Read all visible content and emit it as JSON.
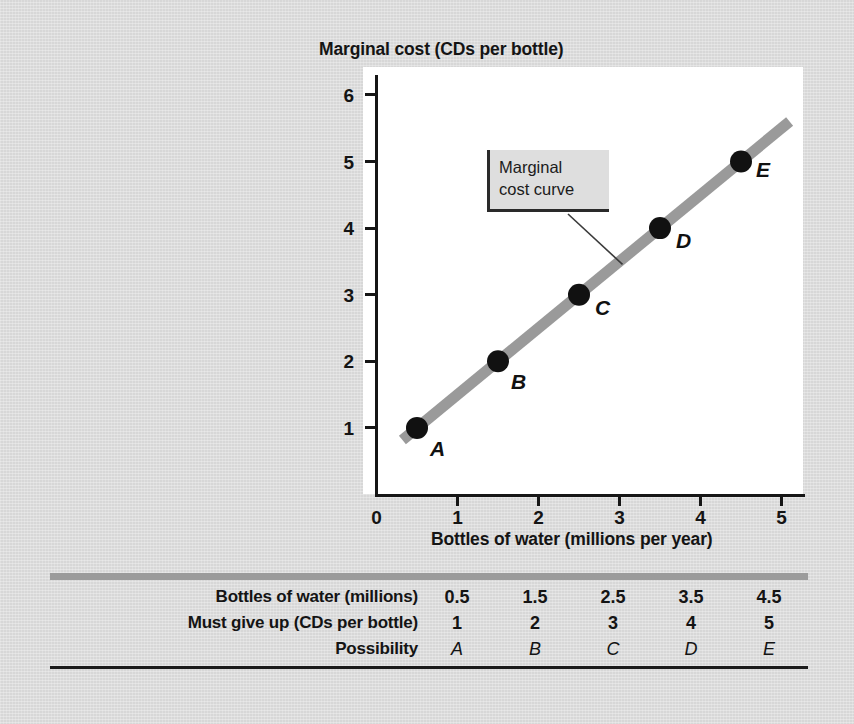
{
  "figure": {
    "background_color": "#dcdcdc",
    "panel_color": "#ffffff"
  },
  "chart_data": {
    "type": "line",
    "title": "",
    "xlabel": "Bottles of water (millions per year)",
    "ylabel": "Marginal cost (CDs per bottle)",
    "xlim": [
      0,
      5.4
    ],
    "ylim": [
      0,
      6.4
    ],
    "xticks": [
      "0",
      "1",
      "2",
      "3",
      "4",
      "5"
    ],
    "yticks": [
      "1",
      "2",
      "3",
      "4",
      "5",
      "6"
    ],
    "grid": false,
    "legend_position": "none",
    "series": [
      {
        "name": "Marginal cost curve",
        "color": "#9a9a9a",
        "x": [
          0.5,
          1.5,
          2.5,
          3.5,
          4.5
        ],
        "values": [
          1,
          2,
          3,
          4,
          5
        ],
        "point_labels": [
          "A",
          "B",
          "C",
          "D",
          "E"
        ],
        "line_extent_x": [
          0.32,
          5.1
        ]
      }
    ],
    "annotations": [
      {
        "text": "Marginal\ncost curve",
        "target_x": 3.0,
        "target_y": 3.5
      }
    ]
  },
  "points": [
    {
      "label": "A",
      "x": 0.5,
      "y": 1,
      "label_dx": 13,
      "label_dy": 10
    },
    {
      "label": "B",
      "x": 1.5,
      "y": 2,
      "label_dx": 13,
      "label_dy": 10
    },
    {
      "label": "C",
      "x": 2.5,
      "y": 3,
      "label_dx": 16,
      "label_dy": 2
    },
    {
      "label": "D",
      "x": 3.5,
      "y": 4,
      "label_dx": 16,
      "label_dy": 2
    },
    {
      "label": "E",
      "x": 4.5,
      "y": 5,
      "label_dx": 15,
      "label_dy": -3
    }
  ],
  "annotation": {
    "text": "Marginal\ncost curve"
  },
  "table": {
    "rows": [
      {
        "header": "Bottles of water (millions)",
        "cells": [
          "0.5",
          "1.5",
          "2.5",
          "3.5",
          "4.5"
        ]
      },
      {
        "header": "Must give up (CDs per bottle)",
        "cells": [
          "1",
          "2",
          "3",
          "4",
          "5"
        ]
      },
      {
        "header": "Possibility",
        "cells": [
          "A",
          "B",
          "C",
          "D",
          "E"
        ]
      }
    ]
  }
}
